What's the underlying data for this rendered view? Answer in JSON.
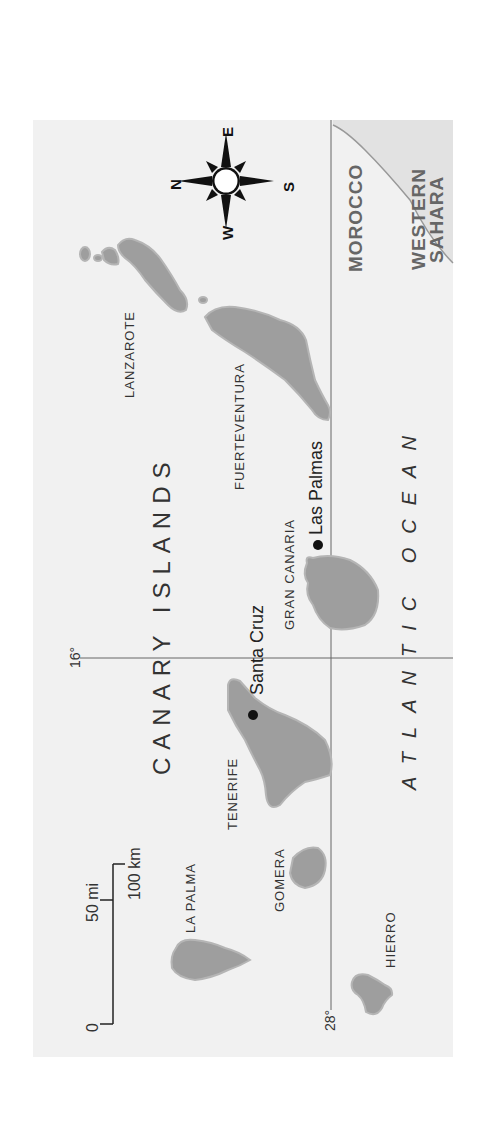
{
  "title": "Canary Islands",
  "colors": {
    "sea": "#f1f1f1",
    "land": "#9e9e9e",
    "land_edge": "#b5b5b5",
    "mainland": "#e2e2e2",
    "grid_line": "#666666",
    "city_marker": "#111111"
  },
  "map": {
    "region_label": "CANARY ISLANDS",
    "ocean_label": "ATLANTIC OCEAN",
    "countries": [
      {
        "id": "morocco",
        "label": "MOROCCO"
      },
      {
        "id": "western-sahara",
        "label_line1": "WESTERN",
        "label_line2": "SAHARA"
      }
    ],
    "islands": [
      {
        "id": "lanzarote",
        "label": "LANZAROTE"
      },
      {
        "id": "fuerteventura",
        "label": "FUERTEVENTURA"
      },
      {
        "id": "gran-canaria",
        "label": "GRAN CANARIA"
      },
      {
        "id": "tenerife",
        "label": "TENERIFE"
      },
      {
        "id": "gomera",
        "label": "GOMERA"
      },
      {
        "id": "la-palma",
        "label": "LA PALMA"
      },
      {
        "id": "hierro",
        "label": "HIERRO"
      }
    ],
    "cities": [
      {
        "id": "las-palmas",
        "label": "Las Palmas"
      },
      {
        "id": "santa-cruz",
        "label": "Santa Cruz"
      }
    ],
    "grid": {
      "meridian_label": "16°",
      "parallel_label": "28°"
    },
    "scale": {
      "zero": "0",
      "miles": "50 mi",
      "km": "100 km"
    },
    "compass": {
      "n": "N",
      "e": "E",
      "s": "S",
      "w": "W"
    }
  }
}
